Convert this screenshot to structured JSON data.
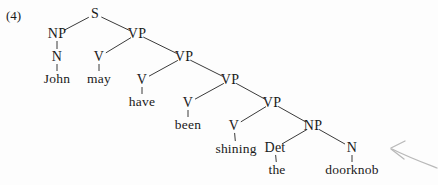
{
  "figure": {
    "example_number": "(4)",
    "sentence": "John may have been shining the doorknob",
    "nodes": [
      {
        "id": "s",
        "label": "S",
        "x": 95,
        "y": 14,
        "kind": "nonterminal"
      },
      {
        "id": "np1",
        "label": "NP",
        "x": 57,
        "y": 34,
        "kind": "nonterminal"
      },
      {
        "id": "vp1",
        "label": "VP",
        "x": 137,
        "y": 34,
        "kind": "nonterminal"
      },
      {
        "id": "n1",
        "label": "N",
        "x": 57,
        "y": 57,
        "kind": "nonterminal"
      },
      {
        "id": "v1",
        "label": "V",
        "x": 99,
        "y": 57,
        "kind": "nonterminal"
      },
      {
        "id": "vp2",
        "label": "VP",
        "x": 184,
        "y": 57,
        "kind": "nonterminal"
      },
      {
        "id": "john",
        "label": "John",
        "x": 57,
        "y": 79,
        "kind": "terminal"
      },
      {
        "id": "may",
        "label": "may",
        "x": 99,
        "y": 79,
        "kind": "terminal"
      },
      {
        "id": "v2",
        "label": "V",
        "x": 142,
        "y": 80,
        "kind": "nonterminal"
      },
      {
        "id": "vp3",
        "label": "VP",
        "x": 230,
        "y": 80,
        "kind": "nonterminal"
      },
      {
        "id": "have",
        "label": "have",
        "x": 142,
        "y": 102,
        "kind": "terminal"
      },
      {
        "id": "v3",
        "label": "V",
        "x": 188,
        "y": 103,
        "kind": "nonterminal"
      },
      {
        "id": "vp4",
        "label": "VP",
        "x": 272,
        "y": 103,
        "kind": "nonterminal"
      },
      {
        "id": "been",
        "label": "been",
        "x": 188,
        "y": 125,
        "kind": "terminal"
      },
      {
        "id": "v4",
        "label": "V",
        "x": 234,
        "y": 126,
        "kind": "nonterminal"
      },
      {
        "id": "np2",
        "label": "NP",
        "x": 313,
        "y": 126,
        "kind": "nonterminal"
      },
      {
        "id": "shining",
        "label": "shining",
        "x": 236,
        "y": 149,
        "kind": "terminal"
      },
      {
        "id": "det",
        "label": "Det",
        "x": 275,
        "y": 148,
        "kind": "nonterminal"
      },
      {
        "id": "n2",
        "label": "N",
        "x": 352,
        "y": 148,
        "kind": "nonterminal"
      },
      {
        "id": "the",
        "label": "the",
        "x": 277,
        "y": 170,
        "kind": "terminal"
      },
      {
        "id": "doorknob",
        "label": "doorknob",
        "x": 352,
        "y": 170,
        "kind": "terminal"
      }
    ],
    "edges": [
      {
        "from": "s",
        "to": "np1"
      },
      {
        "from": "s",
        "to": "vp1"
      },
      {
        "from": "np1",
        "to": "n1"
      },
      {
        "from": "n1",
        "to": "john"
      },
      {
        "from": "vp1",
        "to": "v1"
      },
      {
        "from": "v1",
        "to": "may"
      },
      {
        "from": "vp1",
        "to": "vp2"
      },
      {
        "from": "vp2",
        "to": "v2"
      },
      {
        "from": "v2",
        "to": "have"
      },
      {
        "from": "vp2",
        "to": "vp3"
      },
      {
        "from": "vp3",
        "to": "v3"
      },
      {
        "from": "v3",
        "to": "been"
      },
      {
        "from": "vp3",
        "to": "vp4"
      },
      {
        "from": "vp4",
        "to": "v4"
      },
      {
        "from": "v4",
        "to": "shining"
      },
      {
        "from": "vp4",
        "to": "np2"
      },
      {
        "from": "np2",
        "to": "det"
      },
      {
        "from": "det",
        "to": "the"
      },
      {
        "from": "np2",
        "to": "n2"
      },
      {
        "from": "n2",
        "to": "doorknob"
      }
    ],
    "annotation_arrow": {
      "present": true,
      "color": "#b9b9b9",
      "direction": "points-left"
    },
    "colors": {
      "background": "#fdfdfd",
      "text": "#1a1a1a",
      "edge": "#3a3a3a"
    }
  }
}
